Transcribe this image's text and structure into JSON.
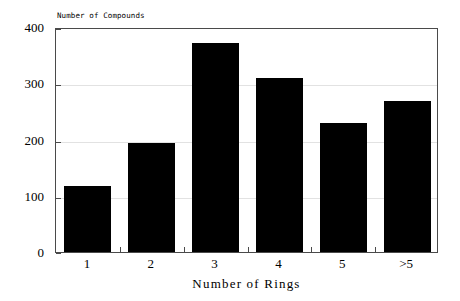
{
  "chart_data": {
    "type": "bar",
    "title": "",
    "subtitle": "",
    "categories": [
      "1",
      "2",
      "3",
      "4",
      "5",
      ">5"
    ],
    "values": [
      118,
      193,
      372,
      310,
      229,
      268
    ],
    "series": [
      {
        "name": "Number of Compounds",
        "values": [
          118,
          193,
          372,
          310,
          229,
          268
        ]
      }
    ],
    "xlabel": "Number of Rings",
    "ylabel": "Number of Compounds",
    "ylabel_position": "above-axis-left",
    "ylim": [
      0,
      400
    ],
    "yticks": [
      0,
      100,
      200,
      300,
      400
    ],
    "ytick_labels": [
      "0",
      "100",
      "200",
      "300",
      "400"
    ],
    "xtick_labels": [
      "1",
      "2",
      "3",
      "4",
      "5",
      ">5"
    ],
    "grid": true,
    "grid_axis": "y",
    "grid_color": "#e2e2e2",
    "legend": false,
    "legend_position": "none",
    "bar_color": "#000000",
    "frame_color": "#4a4a4a",
    "background_color": "#ffffff",
    "annotations": []
  }
}
